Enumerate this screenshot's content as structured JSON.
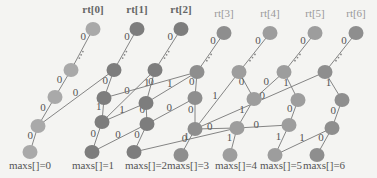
{
  "diagram": {
    "roots": [
      {
        "label": "rt[0]",
        "style": "bold"
      },
      {
        "label": "rt[1]",
        "style": "bold"
      },
      {
        "label": "rt[2]",
        "style": "bold"
      },
      {
        "label": "rt[3]",
        "style": "light"
      },
      {
        "label": "rt[4]",
        "style": "light"
      },
      {
        "label": "rt[5]",
        "style": "light"
      },
      {
        "label": "rt[6]",
        "style": "light"
      }
    ],
    "maxs_labels": [
      "maxs[]=0",
      "maxs[]=1",
      "maxs[]=2",
      "maxs[]=3",
      "maxs[]=4",
      "maxs[]=5",
      "maxs[]=6"
    ],
    "colors": {
      "root0": "#a9a9a9",
      "dark": "#7d7d7d",
      "mid": "#8e8e8e",
      "light": "#9d9d9d"
    },
    "nodes": [
      {
        "id": "r0",
        "color": "root0"
      },
      {
        "id": "r1",
        "color": "dark"
      },
      {
        "id": "r2",
        "color": "dark"
      },
      {
        "id": "r3",
        "color": "mid"
      },
      {
        "id": "r4",
        "color": "light"
      },
      {
        "id": "r5",
        "color": "light"
      },
      {
        "id": "r6",
        "color": "mid"
      },
      {
        "id": "a0",
        "color": "root0"
      },
      {
        "id": "a1",
        "color": "dark"
      },
      {
        "id": "a2",
        "color": "dark"
      },
      {
        "id": "a3",
        "color": "mid"
      },
      {
        "id": "a4",
        "color": "light"
      },
      {
        "id": "a5",
        "color": "light"
      },
      {
        "id": "a6",
        "color": "mid"
      },
      {
        "id": "b0",
        "color": "root0"
      },
      {
        "id": "b1",
        "color": "dark"
      },
      {
        "id": "b2",
        "color": "dark"
      },
      {
        "id": "b3",
        "color": "mid"
      },
      {
        "id": "b4",
        "color": "light"
      },
      {
        "id": "b5",
        "color": "light"
      },
      {
        "id": "b6",
        "color": "mid"
      },
      {
        "id": "c0",
        "color": "root0"
      },
      {
        "id": "c1",
        "color": "dark"
      },
      {
        "id": "c2",
        "color": "dark"
      },
      {
        "id": "c3",
        "color": "mid"
      },
      {
        "id": "c4",
        "color": "light"
      },
      {
        "id": "c5",
        "color": "light"
      },
      {
        "id": "c6",
        "color": "mid"
      },
      {
        "id": "d0",
        "color": "root0"
      },
      {
        "id": "d1",
        "color": "dark"
      },
      {
        "id": "d2",
        "color": "dark"
      },
      {
        "id": "d3",
        "color": "mid"
      },
      {
        "id": "d4",
        "color": "light"
      },
      {
        "id": "d5",
        "color": "light"
      },
      {
        "id": "d6",
        "color": "mid"
      }
    ],
    "edges": [
      {
        "from": "r0",
        "to": "a0",
        "label": "0",
        "dots": true
      },
      {
        "from": "r1",
        "to": "a1",
        "label": "0",
        "dots": true
      },
      {
        "from": "r2",
        "to": "a2",
        "label": "0",
        "dots": true
      },
      {
        "from": "r3",
        "to": "a3",
        "label": "0",
        "dots": true
      },
      {
        "from": "r4",
        "to": "a4",
        "label": "0",
        "dots": true
      },
      {
        "from": "r5",
        "to": "a5",
        "label": "0",
        "dots": true
      },
      {
        "from": "r6",
        "to": "a6",
        "label": "0",
        "dots": true
      },
      {
        "from": "a0",
        "to": "b0",
        "label": "0"
      },
      {
        "from": "a1",
        "to": "b1",
        "label": "0"
      },
      {
        "from": "a1",
        "to": "c0",
        "label": "0"
      },
      {
        "from": "a2",
        "to": "c1",
        "label": "0"
      },
      {
        "from": "a2",
        "to": "b2",
        "label": "1"
      },
      {
        "from": "a3",
        "to": "b2",
        "label": "1"
      },
      {
        "from": "a3",
        "to": "b3",
        "label": "0"
      },
      {
        "from": "a3",
        "to": "b1",
        "label": "0"
      },
      {
        "from": "a4",
        "to": "b4",
        "label": "0"
      },
      {
        "from": "a4",
        "to": "c3",
        "label": "1"
      },
      {
        "from": "a5",
        "to": "b4",
        "label": "0"
      },
      {
        "from": "a5",
        "to": "b5",
        "label": "1"
      },
      {
        "from": "a6",
        "to": "b6",
        "label": "1"
      },
      {
        "from": "a6",
        "to": "c3",
        "label": "0"
      },
      {
        "from": "b0",
        "to": "c0",
        "label": "0"
      },
      {
        "from": "b1",
        "to": "c1",
        "label": "1"
      },
      {
        "from": "b2",
        "to": "c2",
        "label": "0"
      },
      {
        "from": "b2",
        "to": "c1",
        "label": "1"
      },
      {
        "from": "b3",
        "to": "c3",
        "label": "0"
      },
      {
        "from": "b3",
        "to": "c2",
        "label": "0"
      },
      {
        "from": "b4",
        "to": "c4",
        "label": "1"
      },
      {
        "from": "b5",
        "to": "c5",
        "label": "0"
      },
      {
        "from": "b6",
        "to": "c6",
        "label": "0"
      },
      {
        "from": "c0",
        "to": "d0",
        "label": "0"
      },
      {
        "from": "c1",
        "to": "d1",
        "label": "0"
      },
      {
        "from": "c2",
        "to": "d2",
        "label": "0"
      },
      {
        "from": "c2",
        "to": "d1",
        "label": "0"
      },
      {
        "from": "c3",
        "to": "d3",
        "label": "0"
      },
      {
        "from": "c3",
        "to": "c4",
        "label": "0"
      },
      {
        "from": "c4",
        "to": "d4",
        "label": "1"
      },
      {
        "from": "c4",
        "to": "d2",
        "label": "1"
      },
      {
        "from": "c4",
        "to": "c5",
        "label": "0"
      },
      {
        "from": "c5",
        "to": "d5",
        "label": "1"
      },
      {
        "from": "c6",
        "to": "d5",
        "label": "1"
      },
      {
        "from": "c6",
        "to": "d6",
        "label": "0"
      }
    ]
  }
}
